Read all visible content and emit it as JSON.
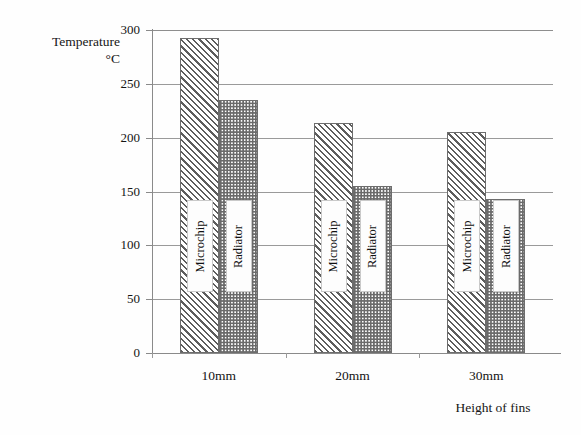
{
  "chart_data": {
    "type": "bar",
    "title": "",
    "ylabel": "Temperature",
    "ylabel_unit": "°C",
    "xlabel": "Height of fins",
    "categories": [
      "10mm",
      "20mm",
      "30mm"
    ],
    "ylim": [
      0,
      300
    ],
    "ytick_labels": [
      "0",
      "50",
      "100",
      "150",
      "200",
      "250",
      "300"
    ],
    "ytick_values": [
      0,
      50,
      100,
      150,
      200,
      250,
      300
    ],
    "grid": true,
    "legend": "in-bar labels",
    "series": [
      {
        "name": "Microchip",
        "values": [
          293,
          214,
          205
        ]
      },
      {
        "name": "Radiator",
        "values": [
          235,
          155,
          143
        ]
      }
    ]
  },
  "axis": {
    "y_title_line1": "Temperature",
    "y_title_line2": "°C",
    "x_title": "Height of fins"
  },
  "bar_labels": {
    "microchip": "Microchip",
    "radiator": "Radiator"
  }
}
